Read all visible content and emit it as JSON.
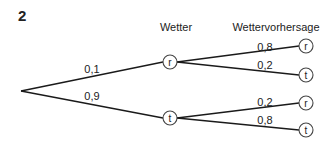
{
  "exercise_number": "2",
  "headers": {
    "level1": "Wetter",
    "level2": "Wettervorhersage"
  },
  "tree": {
    "root": {
      "x": 21,
      "y": 91
    },
    "level1": [
      {
        "id": "n1",
        "label": "r",
        "x": 170,
        "y": 62,
        "edge_prob": "0,1",
        "prob_x": 92,
        "prob_y": 73
      },
      {
        "id": "n2",
        "label": "t",
        "x": 170,
        "y": 118,
        "edge_prob": "0,9",
        "prob_x": 92,
        "prob_y": 100
      }
    ],
    "level2": [
      {
        "parent": "n1",
        "label": "r",
        "x": 306,
        "y": 46,
        "edge_prob": "0,8",
        "prob_x": 265,
        "prob_y": 51
      },
      {
        "parent": "n1",
        "label": "t",
        "x": 306,
        "y": 75,
        "edge_prob": "0,2",
        "prob_x": 265,
        "prob_y": 69
      },
      {
        "parent": "n2",
        "label": "r",
        "x": 306,
        "y": 103,
        "edge_prob": "0,2",
        "prob_x": 265,
        "prob_y": 106
      },
      {
        "parent": "n2",
        "label": "t",
        "x": 306,
        "y": 130,
        "edge_prob": "0,8",
        "prob_x": 265,
        "prob_y": 124
      }
    ]
  }
}
